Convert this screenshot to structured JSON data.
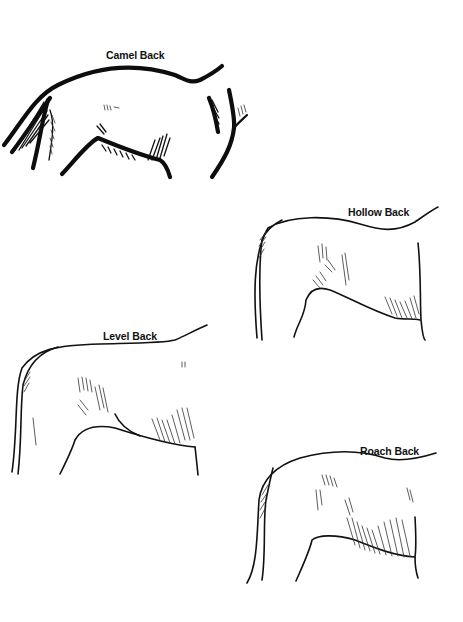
{
  "diagram": {
    "type": "illustration",
    "panels": [
      {
        "id": "camel",
        "label": "Camel Back"
      },
      {
        "id": "hollow",
        "label": "Hollow Back"
      },
      {
        "id": "level",
        "label": "Level Back"
      },
      {
        "id": "roach",
        "label": "Roach Back"
      }
    ]
  },
  "colors": {
    "background": "#ffffff",
    "ink": "#111111"
  }
}
